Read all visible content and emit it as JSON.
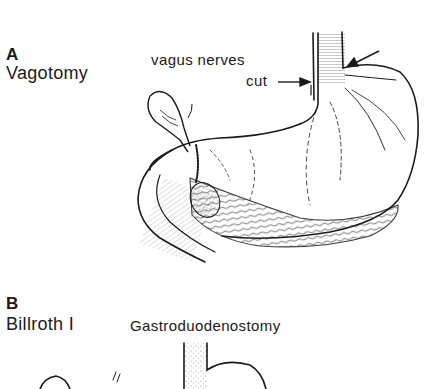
{
  "figure": {
    "panel_a": {
      "letter": "A",
      "title": "Vagotomy",
      "annotation_line1": "vagus nerves",
      "annotation_line2": "cut",
      "illustration": "stomach-with-cut-vagus-nerves"
    },
    "panel_b": {
      "letter": "B",
      "title": "Billroth I",
      "subtitle": "Gastroduodenostomy",
      "illustration": "gastroduodenostomy-stomach"
    },
    "colors": {
      "ink": "#1a1a1a",
      "paper": "#ffffff"
    }
  }
}
